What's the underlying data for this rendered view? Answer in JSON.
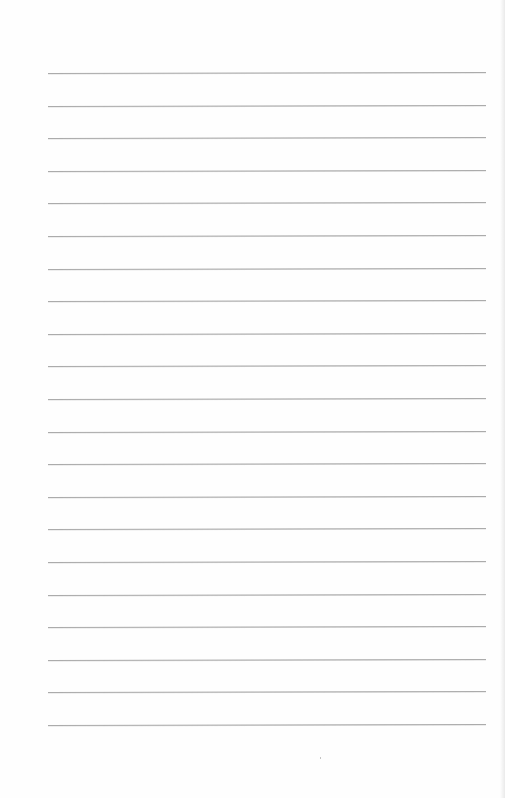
{
  "document": {
    "type": "ruled-paper",
    "content_text": "",
    "rule_count": 21,
    "colors": {
      "paper": "#fefefe",
      "rule": "#ababab"
    }
  }
}
